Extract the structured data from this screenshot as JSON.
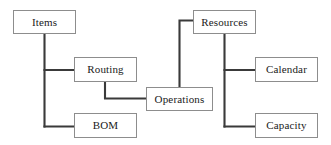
{
  "diagram": {
    "type": "entity-relationship-tree",
    "background_color": "#ffffff",
    "box_border_color": "#8d8d8d",
    "box_fill_color": "#ffffff",
    "connector_color": "#3a3a3a",
    "text_color": "#1a1a1a",
    "nodes": [
      {
        "id": "items",
        "label": "Items",
        "x": 13,
        "y": 10,
        "width": 63,
        "height": 24
      },
      {
        "id": "routing",
        "label": "Routing",
        "x": 74,
        "y": 57,
        "width": 63,
        "height": 25
      },
      {
        "id": "bom",
        "label": "BOM",
        "x": 74,
        "y": 113,
        "width": 63,
        "height": 25
      },
      {
        "id": "operations",
        "label": "Operations",
        "x": 146,
        "y": 87,
        "width": 67,
        "height": 24
      },
      {
        "id": "resources",
        "label": "Resources",
        "x": 193,
        "y": 10,
        "width": 63,
        "height": 24
      },
      {
        "id": "calendar",
        "label": "Calendar",
        "x": 255,
        "y": 57,
        "width": 63,
        "height": 25
      },
      {
        "id": "capacity",
        "label": "Capacity",
        "x": 255,
        "y": 113,
        "width": 63,
        "height": 25
      }
    ],
    "connectors": [
      {
        "id": "items-routing",
        "from": "items",
        "to": "routing",
        "name": "connector-items-routing"
      },
      {
        "id": "items-bom",
        "from": "items",
        "to": "bom",
        "name": "connector-items-bom"
      },
      {
        "id": "routing-operations",
        "from": "routing",
        "to": "operations",
        "name": "connector-routing-operations"
      },
      {
        "id": "resources-operations",
        "from": "resources",
        "to": "operations",
        "name": "connector-resources-operations"
      },
      {
        "id": "resources-calendar",
        "from": "resources",
        "to": "calendar",
        "name": "connector-resources-calendar"
      },
      {
        "id": "resources-capacity",
        "from": "resources",
        "to": "capacity",
        "name": "connector-resources-capacity"
      }
    ]
  }
}
